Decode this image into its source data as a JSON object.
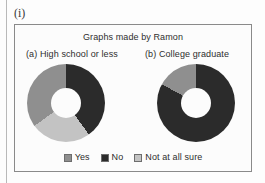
{
  "item_label": "(i)",
  "figure": {
    "title": "Graphs made by Ramon",
    "panels": [
      {
        "caption": "(a) High school or less"
      },
      {
        "caption": "(b) College graduate"
      }
    ],
    "legend": [
      {
        "key": "yes",
        "label": "Yes",
        "color": "#8f8f8f"
      },
      {
        "key": "no",
        "label": "No",
        "color": "#2b2b2b"
      },
      {
        "key": "unsure",
        "label": "Not at all sure",
        "color": "#c3c3c3"
      }
    ]
  },
  "chart_data": [
    {
      "type": "pie",
      "title": "(a) High school or less",
      "donut": true,
      "hole_fraction": 0.385,
      "categories": [
        "No",
        "Not at all sure",
        "Yes"
      ],
      "values": [
        40,
        25,
        35
      ],
      "colors": [
        "#2b2b2b",
        "#c3c3c3",
        "#8f8f8f"
      ],
      "start_angle_deg": 0,
      "direction": "clockwise",
      "units": "percent",
      "legend_position": "bottom"
    },
    {
      "type": "pie",
      "title": "(b) College graduate",
      "donut": true,
      "hole_fraction": 0.385,
      "categories": [
        "No",
        "Yes"
      ],
      "values": [
        83,
        17
      ],
      "colors": [
        "#2b2b2b",
        "#8f8f8f"
      ],
      "start_angle_deg": 0,
      "direction": "clockwise",
      "units": "percent",
      "legend_position": "bottom"
    }
  ]
}
